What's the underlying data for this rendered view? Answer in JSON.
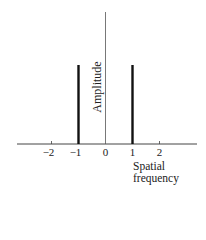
{
  "chart_data": {
    "type": "bar",
    "title": "",
    "xlabel": "Spatial frequency",
    "xlabel_lines": [
      "Spatial",
      "frequency"
    ],
    "ylabel": "Amplitude",
    "x_ticks": [
      -2,
      -1,
      0,
      1,
      2
    ],
    "x_tick_labels": [
      "−2",
      "−1",
      "0",
      "1",
      "2"
    ],
    "series": [
      {
        "name": "spectrum",
        "x": [
          -1,
          1
        ],
        "values": [
          1,
          1
        ]
      }
    ],
    "xlim": [
      -3.4,
      3.5
    ],
    "ylim": [
      0,
      1.66
    ],
    "grid": false,
    "legend": null,
    "colors": {
      "axis": "#444444",
      "bars": "#111111"
    }
  }
}
